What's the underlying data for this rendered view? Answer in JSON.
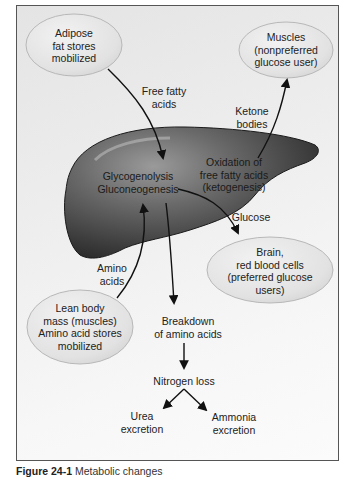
{
  "diagram": {
    "nodes": {
      "adipose": [
        "Adipose",
        "fat stores",
        "mobilized"
      ],
      "muscles": [
        "Muscles",
        "(nonpreferred",
        "glucose user)"
      ],
      "brain": [
        "Brain,",
        "red blood cells",
        "(preferred glucose",
        "users)"
      ],
      "lean": [
        "Lean body",
        "mass (muscles)",
        "Amino acid stores",
        "mobilized"
      ],
      "liver_left": [
        "Glycogenolysis",
        "Gluconeogenesis"
      ],
      "liver_right": [
        "Oxidation of",
        "free fatty acids",
        "(ketogenesis)"
      ]
    },
    "edges": {
      "ffa": [
        "Free fatty",
        "acids"
      ],
      "ketone": [
        "Ketone",
        "bodies"
      ],
      "glucose": "Glucose",
      "amino": [
        "Amino",
        "acids"
      ],
      "breakdown": [
        "Breakdown",
        "of amino acids"
      ],
      "nitrogen": "Nitrogen loss",
      "urea": [
        "Urea",
        "excretion"
      ],
      "ammonia": [
        "Ammonia",
        "excretion"
      ]
    },
    "colors": {
      "oval_fill": "#e6e6e6",
      "liver_dark": "#2e2e2e",
      "liver_light": "#8a8a8a",
      "arrow": "#111111"
    }
  },
  "caption": {
    "figure": "Figure 24-1",
    "text": "Metabolic changes"
  }
}
